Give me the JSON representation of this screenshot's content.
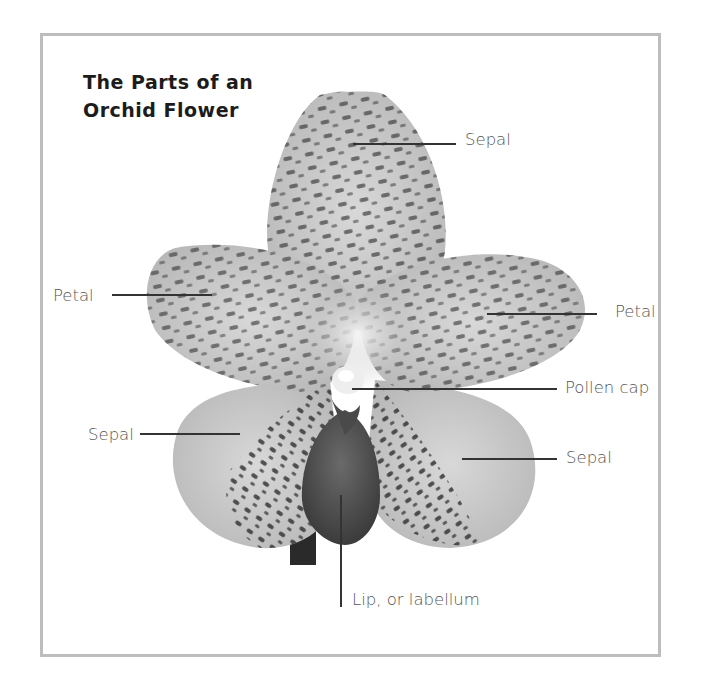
{
  "diagram": {
    "title_lines": [
      "The Parts of an",
      "Orchid Flower"
    ],
    "labels": {
      "top_sepal": "Sepal",
      "left_petal": "Petal",
      "right_petal": "Petal",
      "pollen_cap": "Pollen cap",
      "left_sepal": "Sepal",
      "right_sepal": "Sepal",
      "lip": "Lip, or labellum"
    },
    "colors": {
      "frame_border": "#bdbdbd",
      "petal_base": "#c9c9c9",
      "spots": "#3a3a3a",
      "lip": "#5a5a5a",
      "label_text": "#555555",
      "title_text": "#1c1c1c"
    }
  }
}
